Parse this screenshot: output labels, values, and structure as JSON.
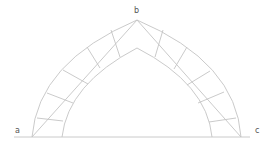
{
  "diagram": {
    "labels": {
      "a": "a",
      "b": "b",
      "c": "c"
    },
    "colors": {
      "line": "#c4c4c4",
      "text": "#555555",
      "background": "#ffffff"
    },
    "points": {
      "a": [
        32,
        137
      ],
      "b": [
        137,
        20
      ],
      "c": [
        241,
        137
      ],
      "inner_left_base": [
        62,
        137
      ],
      "inner_right_base": [
        212,
        137
      ],
      "inner_apex": [
        137,
        48
      ]
    },
    "joints_left": [
      [
        [
          37,
          118
        ],
        [
          63,
          121
        ]
      ],
      [
        [
          47,
          93
        ],
        [
          73,
          103
        ]
      ],
      [
        [
          63,
          70
        ],
        [
          88,
          84
        ]
      ],
      [
        [
          87,
          47
        ],
        [
          100,
          68
        ]
      ],
      [
        [
          111,
          30
        ],
        [
          120,
          57
        ]
      ]
    ],
    "joints_right": [
      [
        [
          163,
          30
        ],
        [
          155,
          57
        ]
      ],
      [
        [
          187,
          47
        ],
        [
          174,
          69
        ]
      ],
      [
        [
          210,
          71
        ],
        [
          187,
          85
        ]
      ],
      [
        [
          224,
          92
        ],
        [
          198,
          103
        ]
      ],
      [
        [
          236,
          118
        ],
        [
          209,
          122
        ]
      ]
    ]
  }
}
